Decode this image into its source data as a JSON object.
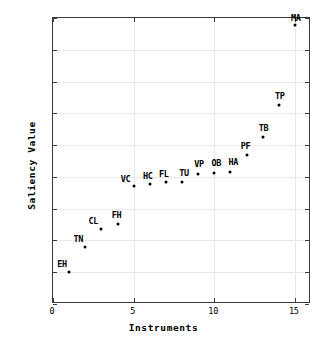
{
  "chart_data": {
    "type": "scatter",
    "title": "",
    "xlabel": "Instruments",
    "ylabel": "Saliency Value",
    "xlim": [
      0,
      16
    ],
    "ylim": [
      -0.4,
      0.5
    ],
    "xticks": [
      "0",
      "5",
      "10",
      "15"
    ],
    "xtick_values": [
      0,
      5,
      10,
      15
    ],
    "yticks": [
      "0.5",
      "0.4",
      "0.3",
      "0.2",
      "0.1",
      "0",
      "-0.1",
      "-0.2",
      "-0.3",
      "-0.4"
    ],
    "ytick_values": [
      0.5,
      0.4,
      0.3,
      0.2,
      0.1,
      0,
      -0.1,
      -0.2,
      -0.3,
      -0.4
    ],
    "grid": true,
    "legend": "none",
    "marker_color": "#000000",
    "points": [
      {
        "label": "EH",
        "x": 1,
        "y": -0.3
      },
      {
        "label": "TN",
        "x": 2,
        "y": -0.22
      },
      {
        "label": "CL",
        "x": 3,
        "y": -0.165
      },
      {
        "label": "FH",
        "x": 4,
        "y": -0.148
      },
      {
        "label": "VC",
        "x": 5,
        "y": -0.028
      },
      {
        "label": "HC",
        "x": 6,
        "y": -0.023
      },
      {
        "label": "FL",
        "x": 7,
        "y": -0.017
      },
      {
        "label": "TU",
        "x": 8,
        "y": -0.015
      },
      {
        "label": "VP",
        "x": 9,
        "y": 0.01
      },
      {
        "label": "OB",
        "x": 10,
        "y": 0.012
      },
      {
        "label": "HA",
        "x": 11,
        "y": 0.015
      },
      {
        "label": "PF",
        "x": 12,
        "y": 0.07
      },
      {
        "label": "TB",
        "x": 13,
        "y": 0.125
      },
      {
        "label": "TP",
        "x": 14,
        "y": 0.225
      },
      {
        "label": "MA",
        "x": 15,
        "y": 0.478
      }
    ]
  }
}
